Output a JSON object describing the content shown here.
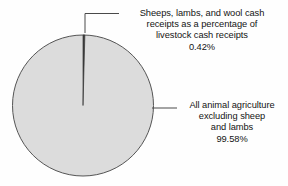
{
  "chart_data": {
    "type": "pie",
    "title": "",
    "categories": [
      "Sheeps, lambs, and wool cash receipts as a percentage of livestock cash receipts",
      "All animal agriculture excluding sheep and lambs"
    ],
    "values": [
      0.42,
      99.58
    ],
    "value_unit": "%",
    "legend_position": "callout-labels",
    "grid": false,
    "slices": [
      {
        "name": "sheep-lambs-wool",
        "percent_label": "0.42%",
        "percent_value": 0.42,
        "color": "#3a3a3a",
        "start_angle_deg": 0,
        "sweep_deg": 1.512
      },
      {
        "name": "all-animal-agriculture-excluding-sheep",
        "percent_label": "99.58%",
        "percent_value": 99.58,
        "color": "#dcdcdc",
        "start_angle_deg": 1.512,
        "sweep_deg": 358.488
      }
    ]
  },
  "labels": {
    "sheep_callout": {
      "lines": [
        "Sheeps, lambs, and wool cash",
        "receipts as a percentage of",
        "livestock cash receipts",
        "0.42%"
      ]
    },
    "other_callout": {
      "lines": [
        "All animal agriculture",
        "excluding sheep",
        "and lambs",
        "99.58%"
      ]
    }
  },
  "style": {
    "pie_fill": "#dcdcdc",
    "pie_stroke": "#555555",
    "wedge_fill": "#3a3a3a",
    "leader_stroke": "#4a4a4a",
    "background": "#fefefe",
    "text_color": "#141414"
  }
}
